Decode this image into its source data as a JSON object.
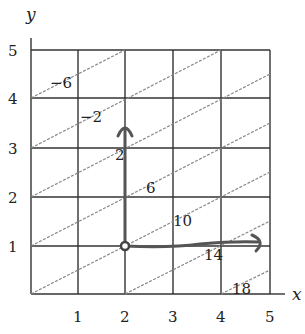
{
  "figure": {
    "x_axis_label": "x",
    "y_axis_label": "y",
    "x_ticks": [
      "1",
      "2",
      "3",
      "4",
      "5"
    ],
    "y_ticks": [
      "1",
      "2",
      "3",
      "4",
      "5"
    ],
    "contour_labels": [
      "−6",
      "−2",
      "2",
      "6",
      "10",
      "14",
      "18"
    ],
    "start_point": {
      "x": 2,
      "y": 1
    },
    "arrows": [
      {
        "direction": "up",
        "from": [
          2,
          1
        ],
        "to": [
          2,
          3.4
        ]
      },
      {
        "direction": "right",
        "from": [
          2,
          1
        ],
        "to": [
          4.8,
          1.1
        ]
      }
    ],
    "colors": {
      "grid": "#333333",
      "contour": "#888888",
      "arrow": "#555555"
    }
  }
}
